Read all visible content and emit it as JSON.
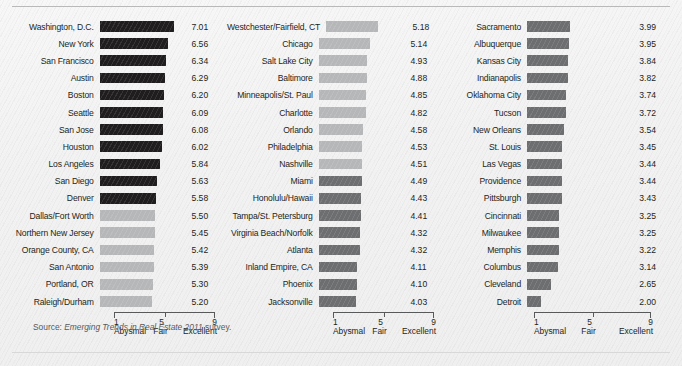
{
  "source_note": {
    "prefix": "Source: ",
    "italic": "Emerging Trends in Real Estate 2011",
    "suffix": " survey."
  },
  "axis": {
    "ticks": [
      "1",
      "5",
      "9"
    ],
    "tick_labels": [
      "Abysmal",
      "Fair",
      "Excellent"
    ],
    "min": 1,
    "max": 9
  },
  "colors": {
    "bar_dark": "#201d1e",
    "bar_mid": "#6d6e70",
    "bar_light": "#b6b7b9",
    "text": "#231f20",
    "axis": "#58595b",
    "background": "#f2f2f2"
  },
  "chart_data": {
    "type": "bar",
    "title": "",
    "subtitle": "",
    "xlabel": "",
    "ylabel": "",
    "xlim": [
      1,
      9
    ],
    "grid": false,
    "legend": "none",
    "orientation": "horizontal",
    "panels": [
      {
        "panel_index": 0,
        "categories": [
          "Washington, D.C.",
          "New York",
          "San Francisco",
          "Austin",
          "Boston",
          "Seattle",
          "San Jose",
          "Houston",
          "Los Angeles",
          "San Diego",
          "Denver",
          "Dallas/Fort Worth",
          "Northern New Jersey",
          "Orange County, CA",
          "San Antonio",
          "Portland, OR",
          "Raleigh/Durham"
        ],
        "values": [
          7.01,
          6.56,
          6.34,
          6.29,
          6.2,
          6.09,
          6.08,
          6.02,
          5.84,
          5.63,
          5.58,
          5.5,
          5.45,
          5.42,
          5.39,
          5.3,
          5.2
        ],
        "shades": [
          "dark",
          "dark",
          "dark",
          "dark",
          "dark",
          "dark",
          "dark",
          "dark",
          "dark",
          "dark",
          "dark",
          "light",
          "light",
          "light",
          "light",
          "light",
          "light"
        ]
      },
      {
        "panel_index": 1,
        "categories": [
          "Westchester/Fairfield, CT",
          "Chicago",
          "Salt Lake City",
          "Baltimore",
          "Minneapolis/St. Paul",
          "Charlotte",
          "Orlando",
          "Philadelphia",
          "Nashville",
          "Miami",
          "Honolulu/Hawaii",
          "Tampa/St. Petersburg",
          "Virginia Beach/Norfolk",
          "Atlanta",
          "Inland Empire, CA",
          "Phoenix",
          "Jacksonville"
        ],
        "values": [
          5.18,
          5.14,
          4.93,
          4.88,
          4.85,
          4.82,
          4.58,
          4.53,
          4.51,
          4.49,
          4.43,
          4.41,
          4.32,
          4.32,
          4.11,
          4.1,
          4.03
        ],
        "shades": [
          "light",
          "light",
          "light",
          "light",
          "light",
          "light",
          "light",
          "light",
          "light",
          "mid",
          "mid",
          "mid",
          "mid",
          "mid",
          "mid",
          "mid",
          "mid"
        ]
      },
      {
        "panel_index": 2,
        "categories": [
          "Sacramento",
          "Albuquerque",
          "Kansas City",
          "Indianapolis",
          "Oklahoma City",
          "Tucson",
          "New Orleans",
          "St. Louis",
          "Las Vegas",
          "Providence",
          "Pittsburgh",
          "Cincinnati",
          "Milwaukee",
          "Memphis",
          "Columbus",
          "Cleveland",
          "Detroit"
        ],
        "values": [
          3.99,
          3.95,
          3.84,
          3.82,
          3.74,
          3.72,
          3.54,
          3.45,
          3.44,
          3.44,
          3.43,
          3.25,
          3.25,
          3.22,
          3.14,
          2.65,
          2.0
        ],
        "shades": [
          "mid",
          "mid",
          "mid",
          "mid",
          "mid",
          "mid",
          "mid",
          "mid",
          "mid",
          "mid",
          "mid",
          "mid",
          "mid",
          "mid",
          "mid",
          "mid",
          "mid"
        ]
      }
    ]
  }
}
